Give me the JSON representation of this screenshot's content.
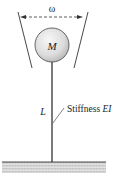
{
  "diagram": {
    "labels": {
      "frequency": "ω",
      "mass": "M",
      "length": "L",
      "stiffness_prefix": "Stiffness ",
      "stiffness_symbol": "EI"
    },
    "colors": {
      "line": "#222222",
      "ball_fill_light": "#f2f2f2",
      "ball_fill_dark": "#bdbdbd",
      "ground_hatch": "#c8c8c8"
    }
  }
}
